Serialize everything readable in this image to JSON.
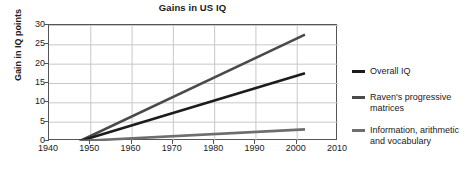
{
  "chart_data": {
    "type": "line",
    "title": "Gains in US IQ",
    "xlabel": "",
    "ylabel": "Gain in IQ points",
    "xlim": [
      1940,
      2010
    ],
    "ylim": [
      0,
      30
    ],
    "xticks": [
      1940,
      1950,
      1960,
      1970,
      1980,
      1990,
      2000,
      2010
    ],
    "yticks": [
      0,
      5,
      10,
      15,
      20,
      25,
      30
    ],
    "grid": true,
    "legend_position": "right",
    "x": [
      1947.5,
      2002
    ],
    "series": [
      {
        "name": "Overall IQ",
        "legend_label": "Overall IQ",
        "values": [
          0,
          17.5
        ],
        "color": "#1c1c1c",
        "width": 2.6
      },
      {
        "name": "Raven's progressive matrices",
        "legend_label": "Raven's progressive\nmatrices",
        "values": [
          0,
          27.5
        ],
        "color": "#4a4a4a",
        "width": 2.6
      },
      {
        "name": "Information, arithmetic and vocabulary",
        "legend_label": "Information, arithmetic\nand vocabulary",
        "values": [
          0,
          3.0
        ],
        "color": "#6e6e6e",
        "width": 2.6
      }
    ]
  },
  "style": {
    "grid_color": "#c8c8c8",
    "axis_color": "#555555",
    "text_color": "#1a1a1a",
    "background": "#ffffff"
  }
}
